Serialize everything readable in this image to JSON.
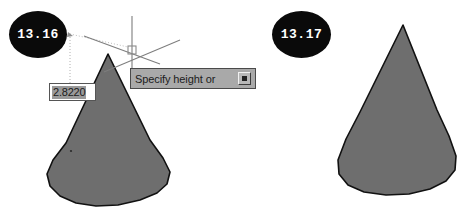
{
  "page": {
    "top_clipped_text": "    .        .             .                 .",
    "background_color": "#ffffff"
  },
  "figures": [
    {
      "badge_label": "13.16",
      "badge_color": "#0a0a0a",
      "badge_text_color": "#ffffff",
      "cone_fill": "#6e6e6e",
      "cone_stroke": "#111111",
      "caption": "cone being created with dynamic height input"
    },
    {
      "badge_label": "13.17",
      "badge_color": "#0a0a0a",
      "badge_text_color": "#ffffff",
      "cone_fill": "#6e6e6e",
      "cone_stroke": "#111111",
      "caption": "finished cone solid"
    }
  ],
  "dynamic_input": {
    "value": "2.8220",
    "placeholder": "2.8220",
    "selected": true,
    "selection_color": "#9a9a9a",
    "border_color": "#555555"
  },
  "command_prompt": {
    "text": "Specify height or",
    "expand_icon": "expand-options-icon",
    "background_color": "#a9a9a9",
    "border_color": "#4a4a4a"
  },
  "cursor": {
    "crosshair_icon": "isometric-crosshair-icon",
    "center_x": 132,
    "center_y": 50,
    "tracking_line_color": "#b9b9b9"
  }
}
